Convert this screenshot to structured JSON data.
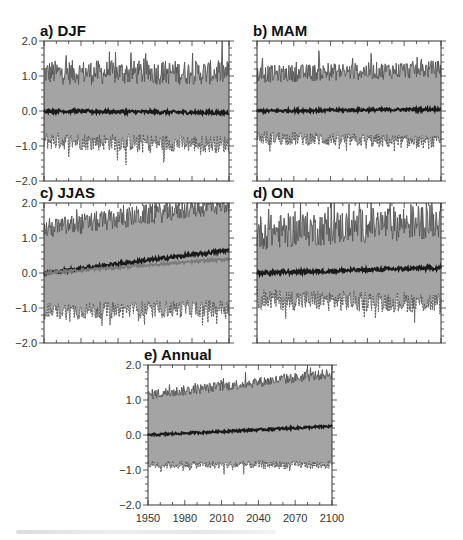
{
  "figure": {
    "caption_visible": false
  },
  "chart_data": [
    {
      "id": "a",
      "type": "area",
      "title": "a) DJF",
      "xlabel": "",
      "ylabel": "",
      "xlim": [
        1950,
        2100
      ],
      "ylim": [
        -2.0,
        2.0
      ],
      "yticks": [
        "2.0",
        "1.0",
        "0.0",
        "-1.0",
        "-2.0"
      ],
      "yticks_values": [
        2.0,
        1.0,
        0.0,
        -1.0,
        -2.0
      ],
      "xticks_labels_shown": false,
      "grid": false,
      "series": [
        {
          "name": "ensemble upper envelope",
          "style": "spread",
          "trend_start": 1.1,
          "trend_end": 1.1,
          "noise": 0.35
        },
        {
          "name": "ensemble mean",
          "style": "mean",
          "trend_start": 0.0,
          "trend_end": -0.05,
          "noise": 0.05
        },
        {
          "name": "ensemble lower envelope",
          "style": "spread",
          "trend_start": -0.85,
          "trend_end": -0.95,
          "noise": 0.25
        }
      ]
    },
    {
      "id": "b",
      "type": "area",
      "title": "b) MAM",
      "xlabel": "",
      "ylabel": "",
      "xlim": [
        1950,
        2100
      ],
      "ylim": [
        -2.0,
        2.0
      ],
      "yticks_labels_shown": false,
      "xticks_labels_shown": false,
      "grid": false,
      "series": [
        {
          "name": "ensemble upper envelope",
          "style": "spread",
          "trend_start": 1.05,
          "trend_end": 1.2,
          "noise": 0.25
        },
        {
          "name": "ensemble mean",
          "style": "mean",
          "trend_start": 0.0,
          "trend_end": 0.05,
          "noise": 0.04
        },
        {
          "name": "ensemble lower envelope",
          "style": "spread",
          "trend_start": -0.75,
          "trend_end": -0.9,
          "noise": 0.2
        }
      ]
    },
    {
      "id": "c",
      "type": "area",
      "title": "c) JJAS",
      "xlabel": "",
      "ylabel": "",
      "xlim": [
        1950,
        2100
      ],
      "ylim": [
        -2.0,
        2.0
      ],
      "yticks": [
        "2.0",
        "1.0",
        "0.0",
        "-1.0",
        "-2.0"
      ],
      "yticks_values": [
        2.0,
        1.0,
        0.0,
        -1.0,
        -2.0
      ],
      "xticks_labels_shown": false,
      "grid": false,
      "series": [
        {
          "name": "ensemble upper envelope",
          "style": "spread",
          "trend_start": 1.25,
          "trend_end": 2.0,
          "noise": 0.3
        },
        {
          "name": "ensemble mean",
          "style": "mean",
          "trend_start": 0.0,
          "trend_end": 0.65,
          "noise": 0.05
        },
        {
          "name": "ensemble mean (alt scenario)",
          "style": "mean-alt",
          "trend_start": 0.0,
          "trend_end": 0.4,
          "noise": 0.04
        },
        {
          "name": "ensemble lower envelope",
          "style": "spread",
          "trend_start": -1.1,
          "trend_end": -1.0,
          "noise": 0.25
        }
      ]
    },
    {
      "id": "d",
      "type": "area",
      "title": "d) ON",
      "xlabel": "",
      "ylabel": "",
      "xlim": [
        1950,
        2100
      ],
      "ylim": [
        -2.0,
        2.0
      ],
      "yticks_labels_shown": false,
      "xticks_labels_shown": false,
      "grid": false,
      "series": [
        {
          "name": "ensemble upper envelope",
          "style": "spread",
          "trend_start": 1.15,
          "trend_end": 1.5,
          "noise": 0.5
        },
        {
          "name": "ensemble mean",
          "style": "mean",
          "trend_start": 0.0,
          "trend_end": 0.15,
          "noise": 0.06
        },
        {
          "name": "ensemble lower envelope",
          "style": "spread",
          "trend_start": -0.75,
          "trend_end": -0.85,
          "noise": 0.3
        }
      ]
    },
    {
      "id": "e",
      "type": "area",
      "title": "e) Annual",
      "xlabel": "",
      "ylabel": "",
      "xlim": [
        1950,
        2100
      ],
      "ylim": [
        -2.0,
        2.0
      ],
      "yticks": [
        "2.0",
        "1.0",
        "0.0",
        "-1.0",
        "-2.0"
      ],
      "yticks_values": [
        2.0,
        1.0,
        0.0,
        -1.0,
        -2.0
      ],
      "xticks": [
        "1950",
        "1980",
        "2010",
        "2040",
        "2070",
        "2100"
      ],
      "xticks_values": [
        1950,
        1980,
        2010,
        2040,
        2070,
        2100
      ],
      "grid": false,
      "series": [
        {
          "name": "ensemble upper envelope",
          "style": "spread",
          "trend_start": 1.15,
          "trend_end": 1.75,
          "noise": 0.15
        },
        {
          "name": "ensemble mean",
          "style": "mean",
          "trend_start": 0.0,
          "trend_end": 0.25,
          "noise": 0.03
        },
        {
          "name": "ensemble lower envelope",
          "style": "spread",
          "trend_start": -0.85,
          "trend_end": -0.85,
          "noise": 0.12
        }
      ]
    }
  ],
  "colors": {
    "spread_fill": "#a4a4a4",
    "envelope_line": "#555555",
    "mean_line": "#1a1a1a",
    "mean_alt_line": "#7a7a7a",
    "axis": "#333333"
  }
}
